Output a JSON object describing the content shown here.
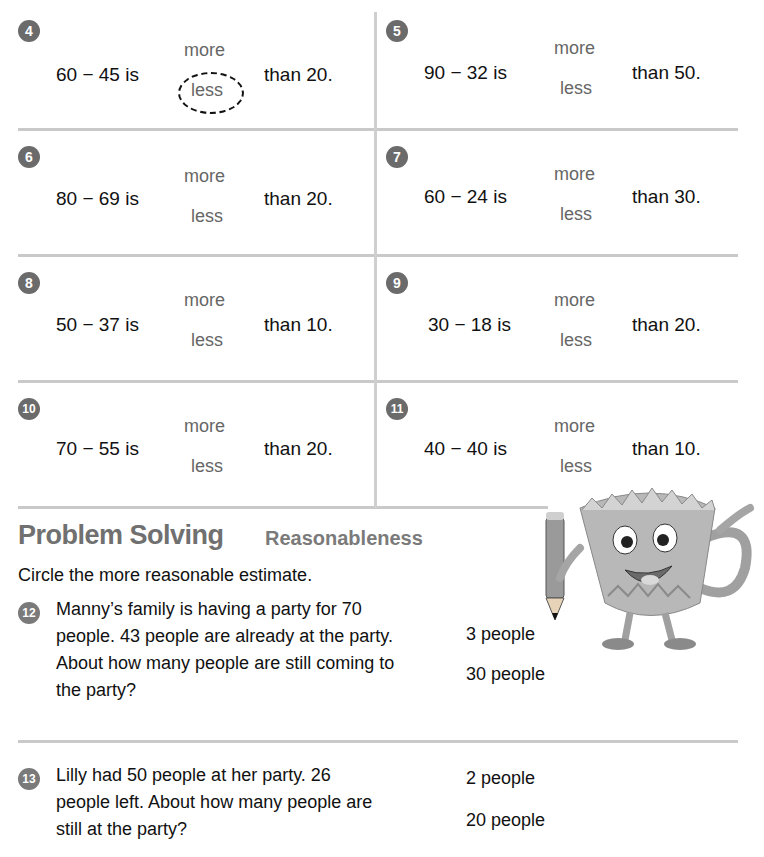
{
  "exercises": [
    {
      "num": "4",
      "expr": "60 − 45 is",
      "more": "more",
      "less": "less",
      "than": "than 20.",
      "circled": "less"
    },
    {
      "num": "5",
      "expr": "90 − 32 is",
      "more": "more",
      "less": "less",
      "than": "than 50.",
      "circled": null
    },
    {
      "num": "6",
      "expr": "80 − 69 is",
      "more": "more",
      "less": "less",
      "than": "than 20.",
      "circled": null
    },
    {
      "num": "7",
      "expr": "60 − 24 is",
      "more": "more",
      "less": "less",
      "than": "than 30.",
      "circled": null
    },
    {
      "num": "8",
      "expr": "50 − 37 is",
      "more": "more",
      "less": "less",
      "than": "than 10.",
      "circled": null
    },
    {
      "num": "9",
      "expr": "30 − 18 is",
      "more": "more",
      "less": "less",
      "than": "than 20.",
      "circled": null
    },
    {
      "num": "10",
      "expr": "70 − 55 is",
      "more": "more",
      "less": "less",
      "than": "than 20.",
      "circled": null
    },
    {
      "num": "11",
      "expr": "40 − 40 is",
      "more": "more",
      "less": "less",
      "than": "than 10.",
      "circled": null
    }
  ],
  "problem_solving": {
    "title": "Problem Solving",
    "subtitle": "Reasonableness",
    "instruction": "Circle the more reasonable estimate.",
    "questions": [
      {
        "num": "12",
        "text": "Manny’s family is having a party for 70 people. 43 people are already at the party. About how many people are still coming to the party?",
        "options": [
          "3 people",
          "30 people"
        ]
      },
      {
        "num": "13",
        "text": "Lilly had 50 people at her party. 26 people left. About how many people are still at the party?",
        "options": [
          "2 people",
          "20 people"
        ]
      }
    ]
  },
  "colors": {
    "badge": "#6b6b6b",
    "rule": "#c9c9c9",
    "heading": "#707070"
  }
}
